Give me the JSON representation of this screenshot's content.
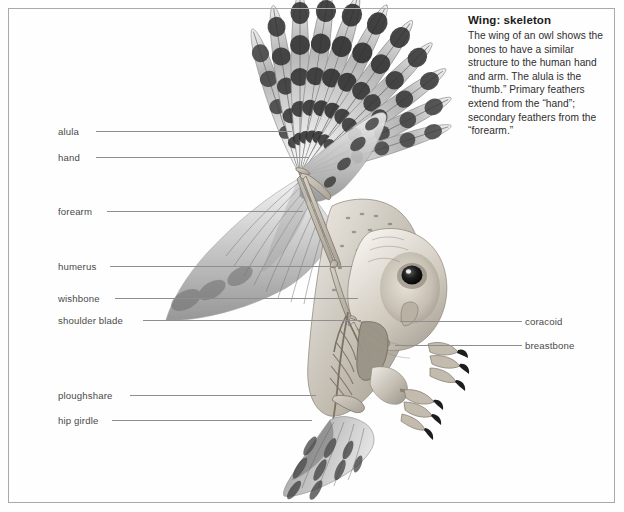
{
  "figure": {
    "title": "Wing: skeleton",
    "body": "The wing of an owl shows the bones to have a similar structure to the human hand and arm. The alula is the “thumb.” Primary feathers extend from the “hand”; secondary feathers from the “forearm.”",
    "medium": "pencil-tonal-drawing"
  },
  "labels_left": [
    {
      "text": "alula",
      "x": 58,
      "y": 126,
      "line_x": 96,
      "line_w": 196,
      "line_y": 131
    },
    {
      "text": "hand",
      "x": 58,
      "y": 152,
      "line_x": 96,
      "line_w": 213,
      "line_y": 157
    },
    {
      "text": "forearm",
      "x": 58,
      "y": 206,
      "line_x": 107,
      "line_w": 196,
      "line_y": 211
    },
    {
      "text": "humerus",
      "x": 58,
      "y": 261,
      "line_x": 110,
      "line_w": 242,
      "line_y": 266
    },
    {
      "text": "wishbone",
      "x": 58,
      "y": 293,
      "line_x": 115,
      "line_w": 243,
      "line_y": 298
    },
    {
      "text": "shoulder blade",
      "x": 58,
      "y": 315,
      "line_x": 143,
      "line_w": 218,
      "line_y": 320
    },
    {
      "text": "ploughshare",
      "x": 58,
      "y": 390,
      "line_x": 130,
      "line_w": 186,
      "line_y": 395
    },
    {
      "text": "hip girdle",
      "x": 58,
      "y": 415,
      "line_x": 112,
      "line_w": 200,
      "line_y": 420
    }
  ],
  "labels_right": [
    {
      "text": "coracoid",
      "x": 525,
      "y": 316,
      "line_x": 400,
      "line_w": 122,
      "line_y": 321
    },
    {
      "text": "breastbone",
      "x": 525,
      "y": 340,
      "line_x": 395,
      "line_w": 127,
      "line_y": 345
    }
  ],
  "colors": {
    "frame": "#a9a9a9",
    "leader": "#8e8e8e",
    "label_text": "#4a4a4a",
    "caption_title": "#1b1b1b",
    "caption_body": "#2e2e2e",
    "page_background": "#ffffff",
    "ink_dark": "#2b2b2b",
    "ink_mid": "#7d7d7d",
    "ink_light": "#c9c9c9",
    "bone": "#b9b2a4"
  }
}
